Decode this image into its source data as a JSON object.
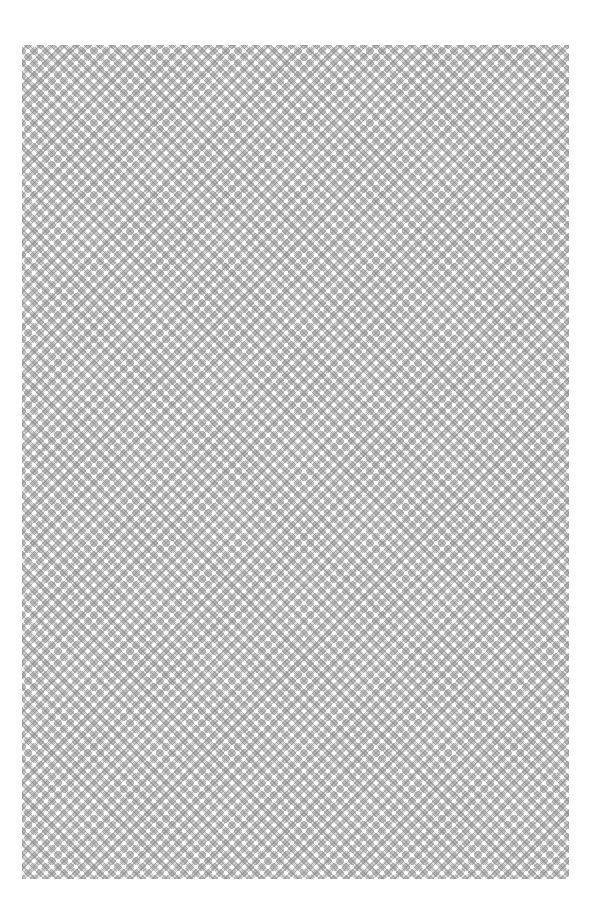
{
  "page": {
    "background_color": "#ffffff",
    "pattern": {
      "type": "diamond-lattice",
      "base_color": "#e6e6e6",
      "dot_color": "#ffffff",
      "diamond_color": "#999999",
      "period_px": 12
    }
  }
}
